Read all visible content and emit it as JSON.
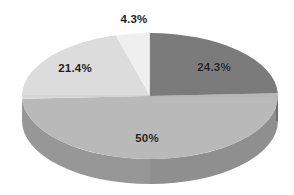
{
  "chart_data": {
    "type": "pie",
    "title": "",
    "subtitle": "",
    "xlabel": "",
    "ylabel": "",
    "grid": false,
    "legend": "none",
    "three_d": true,
    "labels_show_percent": true,
    "categories": [
      "4.3%",
      "24.3%",
      "50%",
      "21.4%"
    ],
    "values": [
      4.3,
      24.3,
      50,
      21.4
    ],
    "slices": [
      {
        "name": "slice-top-sliver",
        "label": "4.3%",
        "value": 4.3,
        "color": "#efefef",
        "side_color": "#c9c9c9",
        "label_position": "outside-top"
      },
      {
        "name": "slice-right",
        "label": "24.3%",
        "value": 24.3,
        "color": "#7b7b7b",
        "side_color": "#5f5f5f",
        "label_position": "inside"
      },
      {
        "name": "slice-bottom",
        "label": "50%",
        "value": 50,
        "color": "#b9b9b9",
        "side_color": "#979797",
        "label_position": "inside"
      },
      {
        "name": "slice-left",
        "label": "21.4%",
        "value": 21.4,
        "color": "#dcdcdc",
        "side_color": "#b4b4b4",
        "label_position": "inside"
      }
    ],
    "colors": {
      "background": "#ffffff",
      "label_text": "#1d1d1d",
      "slice_4_3": "#efefef",
      "slice_24_3": "#7b7b7b",
      "slice_50": "#b9b9b9",
      "slice_21_4": "#dcdcdc"
    },
    "geometry": {
      "center_x": 150,
      "center_y": 96,
      "radius_x": 128,
      "radius_y": 63,
      "depth": 25,
      "start_angle_deg": -90
    }
  },
  "labels": {
    "top": "4.3%",
    "right": "24.3%",
    "bottom": "50%",
    "left": "21.4%"
  }
}
